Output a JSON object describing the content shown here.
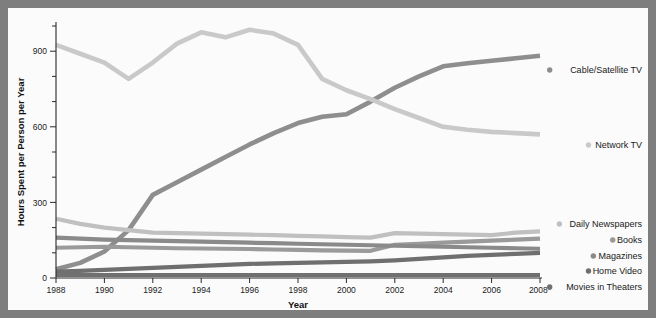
{
  "figure": {
    "background_color": "#7e7e7e",
    "plot_background_color": "#fbfbfb"
  },
  "chart_data": {
    "type": "line",
    "title": "",
    "xlabel": "Year",
    "ylabel": "Hours Spent per Person per Year",
    "xlim": [
      1988,
      2008
    ],
    "ylim": [
      0,
      1000
    ],
    "grid": false,
    "legend_position": "right",
    "x": [
      1988,
      1989,
      1990,
      1991,
      1992,
      1993,
      1994,
      1995,
      1996,
      1997,
      1998,
      1999,
      2000,
      2001,
      2002,
      2003,
      2004,
      2005,
      2006,
      2007,
      2008
    ],
    "xtick_labels": [
      "1988",
      "1990",
      "1992",
      "1994",
      "1996",
      "1998",
      "2000",
      "2002",
      "2004",
      "2006",
      "2008*"
    ],
    "xtick_values": [
      1988,
      1990,
      1992,
      1994,
      1996,
      1998,
      2000,
      2002,
      2004,
      2006,
      2008
    ],
    "ytick_labels": [
      "0",
      "300",
      "600",
      "900"
    ],
    "ytick_values": [
      0,
      300,
      600,
      900
    ],
    "yminor_values": [
      100,
      200,
      400,
      500,
      700,
      800,
      1000
    ],
    "series": [
      {
        "name": "Cable/Satellite TV",
        "color": "#8e8e8e",
        "width": 4.6,
        "label_y": 62,
        "values": [
          35,
          60,
          105,
          190,
          330,
          380,
          430,
          480,
          530,
          575,
          615,
          640,
          650,
          700,
          755,
          800,
          840,
          852,
          862,
          872,
          882
        ]
      },
      {
        "name": "Network TV",
        "color": "#c9c9c9",
        "width": 4.6,
        "label_y": 137,
        "values": [
          925,
          890,
          855,
          790,
          855,
          930,
          975,
          955,
          985,
          970,
          925,
          790,
          745,
          710,
          670,
          635,
          600,
          588,
          580,
          575,
          570
        ]
      },
      {
        "name": "Daily Newspapers",
        "color": "#c0c0c0",
        "width": 4.2,
        "label_y": 216,
        "values": [
          235,
          215,
          200,
          190,
          180,
          178,
          176,
          174,
          172,
          170,
          167,
          165,
          162,
          160,
          178,
          176,
          174,
          172,
          170,
          180,
          185
        ]
      },
      {
        "name": "Books",
        "color": "#9a9a9a",
        "width": 4.2,
        "label_y": 232,
        "values": [
          120,
          122,
          124,
          122,
          120,
          118,
          117,
          116,
          115,
          113,
          112,
          110,
          109,
          108,
          132,
          136,
          140,
          144,
          148,
          152,
          156
        ]
      },
      {
        "name": "Magazines",
        "color": "#8a8a8a",
        "width": 4.2,
        "label_y": 248,
        "values": [
          160,
          156,
          152,
          150,
          148,
          146,
          144,
          142,
          140,
          138,
          136,
          134,
          132,
          130,
          128,
          126,
          124,
          122,
          120,
          118,
          116
        ]
      },
      {
        "name": "Home Video",
        "color": "#6f6f6f",
        "width": 4.2,
        "label_y": 263,
        "values": [
          25,
          28,
          32,
          36,
          40,
          44,
          48,
          52,
          56,
          58,
          60,
          62,
          64,
          66,
          70,
          76,
          82,
          88,
          92,
          96,
          100
        ]
      },
      {
        "name": "Movies in Theaters",
        "color": "#707070",
        "width": 4.0,
        "label_y": 279,
        "values": [
          12,
          12,
          12,
          12,
          12,
          12,
          12,
          12,
          12,
          12,
          12,
          12,
          12,
          12,
          12,
          12,
          12,
          12,
          12,
          12,
          12
        ]
      }
    ]
  }
}
